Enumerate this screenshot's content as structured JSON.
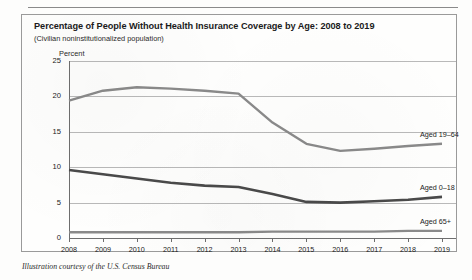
{
  "caption": "Illustration courtesy of the U.S. Census Bureau",
  "figure": {
    "title": "Percentage of People Without Health Insurance Coverage by Age: 2008 to 2019",
    "subtitle": "(Civilian noninstitutionalized population)",
    "axis_unit": "Percent"
  },
  "colors": {
    "series_19_64": "#8a8a8a",
    "series_0_18": "#4a4a4a",
    "series_65_plus": "#8a8a8a",
    "gridline": "#b9b9b9",
    "axis": "#6e6e6e",
    "text": "#222222",
    "box_border": "#9a9a9a"
  },
  "chart_data": {
    "type": "line",
    "title": "Percentage of People Without Health Insurance Coverage by Age: 2008 to 2019",
    "subtitle": "(Civilian noninstitutionalized population)",
    "xlabel": "",
    "ylabel": "Percent",
    "ylim": [
      0,
      25
    ],
    "yticks": [
      0,
      5,
      10,
      15,
      20,
      25
    ],
    "ytick_labels": [
      "0",
      "5",
      "10",
      "15",
      "20",
      "25"
    ],
    "grid": true,
    "legend_position": "right-inline-labels",
    "categories": [
      2008,
      2009,
      2010,
      2011,
      2012,
      2013,
      2014,
      2015,
      2016,
      2017,
      2018,
      2019
    ],
    "xtick_labels": [
      "2008",
      "2009",
      "2010",
      "2011",
      "2012",
      "2013",
      "2014",
      "2015",
      "2016",
      "2017",
      "2018",
      "2019"
    ],
    "series": [
      {
        "name": "Aged 19–64",
        "label": "Aged 19–64",
        "color": "#8a8a8a",
        "values": [
          19.4,
          20.8,
          21.3,
          21.1,
          20.8,
          20.4,
          16.3,
          13.3,
          12.3,
          12.6,
          13.0,
          13.3
        ]
      },
      {
        "name": "Aged 0–18",
        "label": "Aged 0–18",
        "color": "#4a4a4a",
        "values": [
          9.6,
          9.0,
          8.4,
          7.8,
          7.4,
          7.2,
          6.2,
          5.1,
          5.0,
          5.2,
          5.4,
          5.8
        ]
      },
      {
        "name": "Aged 65+",
        "label": "Aged 65+",
        "color": "#8a8a8a",
        "values": [
          0.8,
          0.8,
          0.8,
          0.8,
          0.8,
          0.8,
          0.9,
          0.9,
          0.9,
          0.9,
          1.0,
          1.0
        ]
      }
    ]
  }
}
